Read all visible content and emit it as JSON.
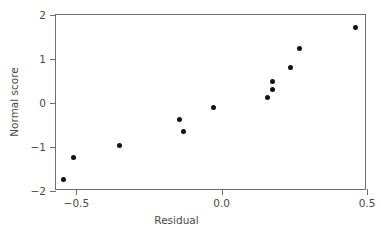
{
  "chart_data": {
    "type": "scatter",
    "title": "",
    "xlabel": "Residual",
    "ylabel": "Normal score",
    "xlim": [
      -0.57,
      0.5
    ],
    "ylim": [
      -2.0,
      2.0
    ],
    "grid": false,
    "legend": "none",
    "xticks": [
      {
        "value": -0.5,
        "label": "−0.5"
      },
      {
        "value": 0.0,
        "label": "0.0"
      },
      {
        "value": 0.5,
        "label": "0.5"
      }
    ],
    "yticks": [
      {
        "value": 2,
        "label": "2"
      },
      {
        "value": 1,
        "label": "1"
      },
      {
        "value": 0,
        "label": "0"
      },
      {
        "value": -1,
        "label": "−1"
      },
      {
        "value": -2,
        "label": "−2"
      }
    ],
    "marker": {
      "shape": "circle",
      "color": "#131313",
      "size_px": 5
    },
    "axis_color": "#6e6e6e",
    "points": [
      {
        "x": -0.543,
        "y": -1.73
      },
      {
        "x": -0.509,
        "y": -1.23
      },
      {
        "x": -0.351,
        "y": -0.96
      },
      {
        "x": -0.146,
        "y": -0.37
      },
      {
        "x": -0.133,
        "y": -0.64
      },
      {
        "x": -0.028,
        "y": -0.1
      },
      {
        "x": 0.156,
        "y": 0.13
      },
      {
        "x": 0.174,
        "y": 0.31
      },
      {
        "x": 0.174,
        "y": 0.48
      },
      {
        "x": 0.236,
        "y": 0.81
      },
      {
        "x": 0.267,
        "y": 1.24
      },
      {
        "x": 0.462,
        "y": 1.72
      }
    ],
    "n_points": 12,
    "annotations": []
  }
}
